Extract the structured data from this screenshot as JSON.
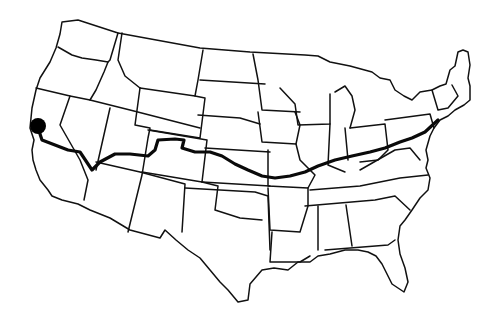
{
  "map": {
    "title": "",
    "region": "Contiguous United States",
    "style": "state outline line drawing",
    "route": {
      "description": "Cross-country route from the California coast to the northeast",
      "start_marker": "filled-circle",
      "start_location": "San Francisco area, California",
      "end_location": "New York City area",
      "states_traversed": [
        "California",
        "Nevada",
        "Utah",
        "Colorado",
        "Nebraska",
        "Iowa",
        "Illinois",
        "Indiana",
        "Ohio",
        "Pennsylvania",
        "New Jersey",
        "New York"
      ]
    },
    "colors": {
      "background": "#ffffff",
      "outline": "#111111",
      "route": "#0a0a0a",
      "marker": "#000000"
    }
  }
}
